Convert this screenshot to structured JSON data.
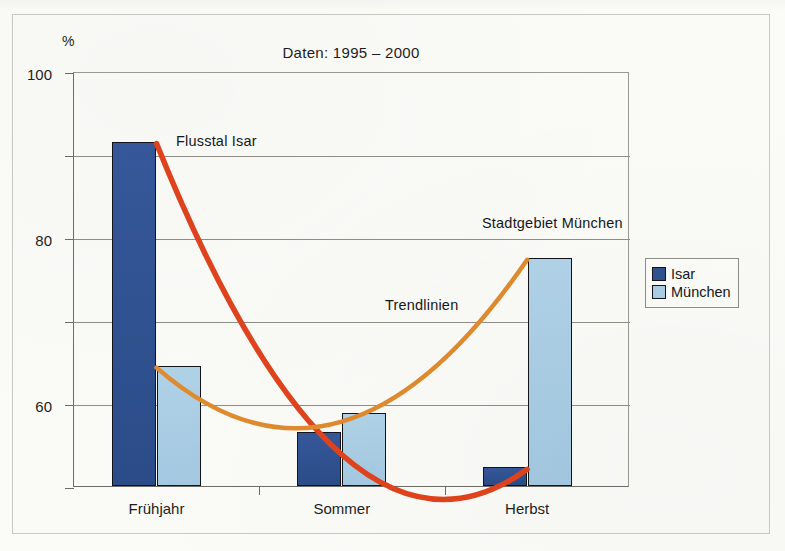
{
  "figure": {
    "title": "Daten: 1995 – 2000",
    "y_axis_unit_label": "%"
  },
  "legend": {
    "position": "right",
    "items": [
      {
        "label": "Isar",
        "color": "#2f528f"
      },
      {
        "label": "München",
        "color": "#a9cde4"
      }
    ]
  },
  "annotations": [
    {
      "id": "flusstal",
      "text": "Flusstal Isar"
    },
    {
      "id": "stadtgebiet",
      "text": "Stadtgebiet München"
    },
    {
      "id": "trendlinien",
      "text": "Trendlinien"
    }
  ],
  "axis": {
    "y_ticks": [
      "100",
      "80",
      "60",
      "40",
      "20",
      "0"
    ],
    "x_ticks": [
      "Frühjahr",
      "Sommer",
      "Herbst"
    ]
  },
  "colors": {
    "bar_isar": "#2f528f",
    "bar_muenchen": "#a9cde4",
    "trend_isar": "#e0431d",
    "trend_muenchen": "#e08a2e",
    "bar_outline": "#13131a",
    "axis": "#6d6d66",
    "grid": "#8e8e86",
    "paper": "#fafbf7"
  },
  "chart_data": {
    "type": "bar",
    "title": "Daten: 1995 – 2000",
    "xlabel": "",
    "ylabel": "%",
    "ylim": [
      0,
      100
    ],
    "ytick_values": [
      0,
      20,
      40,
      60,
      80,
      100
    ],
    "grid": "horizontal",
    "legend_position": "right",
    "categories": [
      "Frühjahr",
      "Sommer",
      "Herbst"
    ],
    "series": [
      {
        "name": "Isar",
        "color": "#2f528f",
        "values": [
          83,
          13,
          4.5
        ]
      },
      {
        "name": "München",
        "color": "#a9cde4",
        "values": [
          29,
          17.5,
          55
        ]
      }
    ],
    "overlays": [
      {
        "type": "line",
        "name": "Trendlinie Isar",
        "label": "Flusstal Isar",
        "color": "#e0431d",
        "points": [
          {
            "x": "Frühjahr",
            "y": 83
          },
          {
            "x": "Sommer",
            "y": 8
          },
          {
            "x": "Herbst",
            "y": 4.5
          }
        ]
      },
      {
        "type": "line",
        "name": "Trendlinie München",
        "label": "Stadtgebiet München",
        "color": "#e08a2e",
        "points": [
          {
            "x": "Frühjahr",
            "y": 29
          },
          {
            "x": "Sommer",
            "y": 16
          },
          {
            "x": "Herbst",
            "y": 55
          }
        ]
      }
    ],
    "annotations": [
      "Flusstal Isar",
      "Stadtgebiet München",
      "Trendlinien"
    ]
  }
}
